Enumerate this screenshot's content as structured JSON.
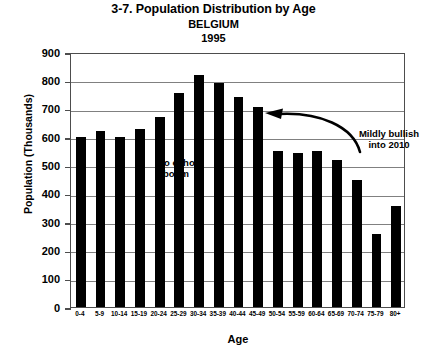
{
  "chart_data": {
    "type": "bar",
    "title": "3-7. Population Distribution by Age",
    "subtitle": "BELGIUM",
    "year_label": "1995",
    "xlabel": "Age",
    "ylabel": "Population (Thousands)",
    "ylim": [
      0,
      900
    ],
    "ytick_values": [
      0,
      100,
      200,
      300,
      400,
      500,
      600,
      700,
      800,
      900
    ],
    "ytick_labels": [
      "0",
      "100",
      "200",
      "300",
      "400",
      "500",
      "600",
      "700",
      "800",
      "900"
    ],
    "grid": "horizontal",
    "legend": "none",
    "bar_color": "#000000",
    "categories": [
      "0-4",
      "5-9",
      "10-14",
      "15-19",
      "20-24",
      "25-29",
      "30-34",
      "35-39",
      "40-44",
      "45-49",
      "50-54",
      "55-59",
      "60-64",
      "65-69",
      "70-74",
      "75-79",
      "80+"
    ],
    "values": [
      600,
      620,
      600,
      630,
      670,
      755,
      820,
      790,
      740,
      705,
      550,
      545,
      552,
      520,
      450,
      258,
      355
    ],
    "annotations": [
      {
        "name": "no-echo-boom",
        "text": "No echo\nboom"
      },
      {
        "name": "mildly-bullish",
        "text": "Mildly bullish\ninto 2010"
      }
    ],
    "arrow": {
      "name": "trend-arrow",
      "description": "curved arrow sweeping right-to-left, pointing toward the 30-34 peak"
    }
  }
}
